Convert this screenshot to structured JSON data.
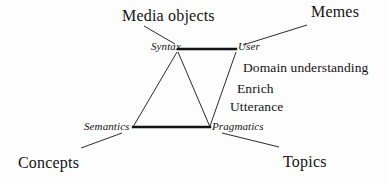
{
  "diagram": {
    "background_color": "#fdfdfd",
    "stroke_color": "#131313",
    "nodes": [
      {
        "id": "syntax",
        "label": "Syntax",
        "x": 178,
        "y": 51,
        "style": "italic"
      },
      {
        "id": "user",
        "label": "User",
        "x": 237,
        "y": 51,
        "style": "italic"
      },
      {
        "id": "semantics",
        "label": "Semantics",
        "x": 133,
        "y": 127,
        "style": "italic"
      },
      {
        "id": "pragmatics",
        "label": "Pragmatics",
        "x": 210,
        "y": 127,
        "style": "italic"
      }
    ],
    "outer_labels": [
      {
        "id": "media-objects",
        "label": "Media objects",
        "x": 122,
        "y": 9,
        "anchor": "left"
      },
      {
        "id": "memes",
        "label": "Memes",
        "x": 311,
        "y": 5,
        "anchor": "left"
      },
      {
        "id": "concepts",
        "label": "Concepts",
        "x": 18,
        "y": 157,
        "anchor": "left"
      },
      {
        "id": "topics",
        "label": "Topics",
        "x": 283,
        "y": 155,
        "anchor": "left"
      }
    ],
    "relation_labels": [
      {
        "id": "domain-understanding",
        "label": "Domain understanding",
        "x": 243,
        "y": 62
      },
      {
        "id": "enrich",
        "label": "Enrich",
        "x": 237,
        "y": 83
      },
      {
        "id": "utterance",
        "label": "Utterance",
        "x": 230,
        "y": 101
      }
    ],
    "edges": [
      {
        "id": "syntax-user",
        "from": "syntax",
        "to": "user",
        "weight": "thick",
        "x1": 178,
        "y1": 49,
        "x2": 236,
        "y2": 49
      },
      {
        "id": "semantics-pragmatics",
        "from": "semantics",
        "to": "pragmatics",
        "weight": "thick",
        "x1": 133,
        "y1": 127,
        "x2": 210,
        "y2": 127
      },
      {
        "id": "syntax-semantics",
        "from": "syntax",
        "to": "semantics",
        "weight": "thin",
        "x1": 177,
        "y1": 52,
        "x2": 133,
        "y2": 127
      },
      {
        "id": "syntax-pragmatics",
        "from": "syntax",
        "to": "pragmatics",
        "weight": "thin",
        "x1": 178,
        "y1": 52,
        "x2": 210,
        "y2": 127
      },
      {
        "id": "user-pragmatics",
        "from": "user",
        "to": "pragmatics",
        "weight": "thin",
        "x1": 236,
        "y1": 52,
        "x2": 210,
        "y2": 126
      }
    ],
    "leader_lines": [
      {
        "id": "leader-media-objects",
        "from": "media-objects",
        "to": "syntax",
        "x1": 144,
        "y1": 26,
        "x2": 175,
        "y2": 44
      },
      {
        "id": "leader-memes",
        "from": "memes",
        "to": "user",
        "x1": 307,
        "y1": 25,
        "x2": 243,
        "y2": 45
      },
      {
        "id": "leader-concepts",
        "from": "concepts",
        "to": "semantics",
        "x1": 81,
        "y1": 148,
        "x2": 122,
        "y2": 133
      },
      {
        "id": "leader-topics",
        "from": "topics",
        "to": "pragmatics",
        "x1": 279,
        "y1": 147,
        "x2": 222,
        "y2": 133
      }
    ]
  }
}
